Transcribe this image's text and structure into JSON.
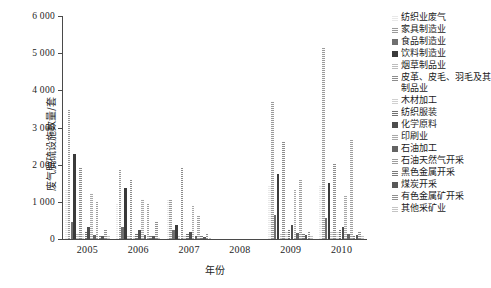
{
  "chart_data": {
    "type": "bar",
    "title": "",
    "xlabel": "年份",
    "ylabel": "废气脱硫设施数量/套",
    "ylim": [
      0,
      6000
    ],
    "yticks": [
      0,
      1000,
      2000,
      3000,
      4000,
      5000,
      6000
    ],
    "ytick_labels": [
      "0",
      "1 000",
      "2 000",
      "3 000",
      "4 000",
      "5 000",
      "6 000"
    ],
    "grid": false,
    "legend_position": "right",
    "categories": [
      "2005",
      "2006",
      "2007",
      "2008",
      "2009",
      "2010"
    ],
    "series": [
      {
        "name": "纺织业废气",
        "color": "#e8e8e8",
        "pattern": "light",
        "values": [
          1330,
          930,
          1080,
          0,
          1430,
          1460
        ]
      },
      {
        "name": "家具制造业",
        "color": "#9a9a9a",
        "pattern": "dots",
        "values": [
          3500,
          1850,
          1050,
          0,
          3700,
          5150
        ]
      },
      {
        "name": "食品制造业",
        "color": "#6f6f6f",
        "pattern": "solid",
        "values": [
          470,
          330,
          250,
          0,
          640,
          560
        ]
      },
      {
        "name": "饮料制造业",
        "color": "#3a3a3a",
        "pattern": "solid",
        "values": [
          2280,
          1360,
          380,
          0,
          1750,
          1520
        ]
      },
      {
        "name": "烟草制品业",
        "color": "#bdbdbd",
        "pattern": "light",
        "values": [
          150,
          120,
          110,
          0,
          170,
          190
        ]
      },
      {
        "name": "皮革、皮毛、羽毛及其制品业",
        "color": "#8c8c8c",
        "pattern": "check",
        "values": [
          1950,
          1620,
          1930,
          0,
          2600,
          2020
        ]
      },
      {
        "name": "木材加工",
        "color": "#d0d0d0",
        "pattern": "light",
        "values": [
          130,
          110,
          90,
          0,
          180,
          200
        ]
      },
      {
        "name": "纺织服装",
        "color": "#707070",
        "pattern": "dots",
        "values": [
          200,
          160,
          140,
          0,
          260,
          240
        ]
      },
      {
        "name": "化学原料",
        "color": "#4d4d4d",
        "pattern": "solid",
        "values": [
          320,
          240,
          180,
          0,
          380,
          330
        ]
      },
      {
        "name": "印刷业",
        "color": "#a8a8a8",
        "pattern": "dots",
        "values": [
          1230,
          1090,
          900,
          0,
          1310,
          1150
        ]
      },
      {
        "name": "石油加工",
        "color": "#636363",
        "pattern": "solid",
        "values": [
          120,
          95,
          80,
          0,
          150,
          140
        ]
      },
      {
        "name": "石油天然气开采",
        "color": "#9e9e9e",
        "pattern": "check",
        "values": [
          1030,
          970,
          640,
          0,
          1620,
          2700
        ]
      },
      {
        "name": "黑色金属开采",
        "color": "#7a7a7a",
        "pattern": "dots",
        "values": [
          110,
          90,
          70,
          0,
          130,
          120
        ]
      },
      {
        "name": "煤炭开采",
        "color": "#585858",
        "pattern": "solid",
        "values": [
          90,
          70,
          55,
          0,
          100,
          95
        ]
      },
      {
        "name": "有色金属矿开采",
        "color": "#8f8f8f",
        "pattern": "check",
        "values": [
          240,
          480,
          130,
          0,
          210,
          180
        ]
      },
      {
        "name": "其他采矿业",
        "color": "#c4c4c4",
        "pattern": "light",
        "values": [
          70,
          55,
          45,
          0,
          80,
          75
        ]
      }
    ]
  },
  "caption": "",
  "axis": {
    "y_title": "废气脱硫设施数量/套",
    "x_title": "年份"
  }
}
